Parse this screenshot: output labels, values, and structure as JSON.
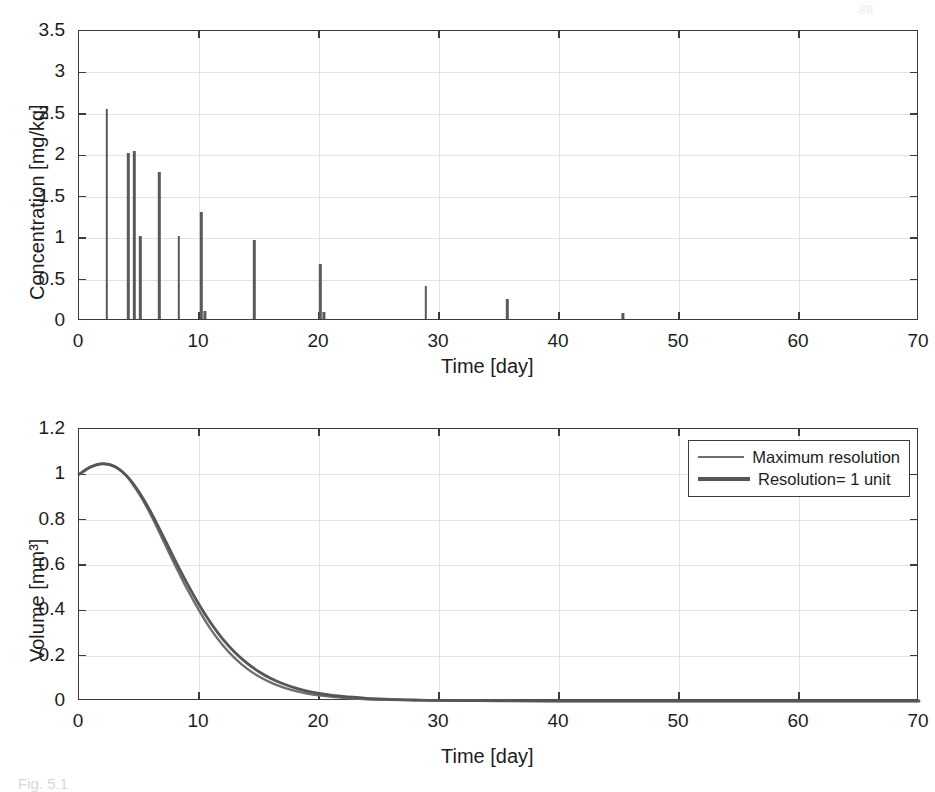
{
  "figure": {
    "caption_fragment": "Fig. 5.1",
    "page_number": "89"
  },
  "chart_data": [
    {
      "id": "concentration-plot",
      "type": "bar",
      "title": "",
      "xlabel": "Time [day]",
      "ylabel": "Concentration [mg/kg]",
      "xlim": [
        0,
        70
      ],
      "ylim": [
        0,
        3.5
      ],
      "xticks": [
        0,
        10,
        20,
        30,
        40,
        50,
        60,
        70
      ],
      "xticklabels": [
        "0",
        "10",
        "20",
        "30",
        "40",
        "50",
        "60",
        "70"
      ],
      "yticks": [
        0,
        0.5,
        1,
        1.5,
        2,
        2.5,
        3,
        3.5
      ],
      "yticklabels": [
        "0",
        "0.5",
        "1",
        "1.5",
        "2",
        "2.5",
        "3",
        "3.5"
      ],
      "grid": true,
      "legend": "none",
      "series_name": "Dose concentration spikes",
      "x": [
        2.3,
        4.1,
        4.6,
        5.1,
        6.7,
        8.3,
        10.2,
        10.5,
        14.6,
        20.1,
        20.4,
        28.9,
        35.7,
        45.3
      ],
      "values": [
        2.53,
        2.0,
        2.03,
        1.0,
        1.77,
        1.0,
        1.29,
        0.1,
        0.95,
        0.67,
        0.09,
        0.4,
        0.24,
        0.07
      ]
    },
    {
      "id": "volume-plot",
      "type": "line",
      "title": "",
      "xlabel": "Time [day]",
      "ylabel": "Volume [mm³]",
      "xlim": [
        0,
        70
      ],
      "ylim": [
        0,
        1.2
      ],
      "xticks": [
        0,
        10,
        20,
        30,
        40,
        50,
        60,
        70
      ],
      "xticklabels": [
        "0",
        "10",
        "20",
        "30",
        "40",
        "50",
        "60",
        "70"
      ],
      "yticks": [
        0,
        0.2,
        0.4,
        0.6,
        0.8,
        1,
        1.2
      ],
      "yticklabels": [
        "0",
        "0.2",
        "0.4",
        "0.6",
        "0.8",
        "1",
        "1.2"
      ],
      "grid": true,
      "legend_position": "upper right",
      "legend": [
        "Maximum resolution",
        "Resolution= 1 unit"
      ],
      "x": [
        0,
        1,
        2,
        3,
        4,
        5,
        6,
        7,
        8,
        9,
        10,
        11,
        12,
        13,
        14,
        15,
        16,
        17,
        18,
        19,
        20,
        22,
        24,
        26,
        28,
        30,
        35,
        40,
        45,
        50,
        55,
        60,
        65,
        70
      ],
      "series": [
        {
          "name": "Maximum resolution",
          "color": "#6e6e6e",
          "values": [
            1.0,
            1.035,
            1.048,
            1.035,
            0.99,
            0.915,
            0.82,
            0.71,
            0.6,
            0.495,
            0.4,
            0.315,
            0.245,
            0.188,
            0.143,
            0.108,
            0.081,
            0.06,
            0.045,
            0.033,
            0.025,
            0.014,
            0.008,
            0.005,
            0.003,
            0.002,
            0.001,
            0.0,
            0.0,
            0.0,
            0.0,
            0.0,
            0.0,
            0.0
          ]
        },
        {
          "name": "Resolution= 1 unit",
          "color": "#565656",
          "values": [
            1.0,
            1.032,
            1.046,
            1.034,
            0.992,
            0.922,
            0.832,
            0.728,
            0.622,
            0.52,
            0.426,
            0.343,
            0.272,
            0.214,
            0.167,
            0.129,
            0.099,
            0.076,
            0.058,
            0.044,
            0.034,
            0.02,
            0.012,
            0.007,
            0.0045,
            0.0028,
            0.001,
            0.0,
            0.0,
            0.0,
            0.0,
            0.0,
            0.0,
            0.0
          ]
        }
      ]
    }
  ]
}
